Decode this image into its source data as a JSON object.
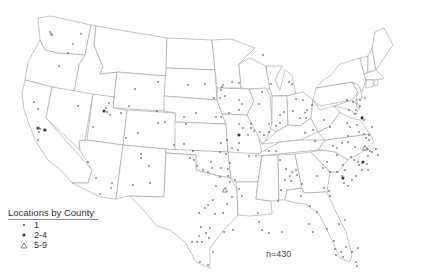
{
  "legend": {
    "title": "Locations by County",
    "items": [
      {
        "symbol": "small-dot",
        "label": "1"
      },
      {
        "symbol": "large-dot",
        "label": "2-4"
      },
      {
        "symbol": "triangle",
        "label": "5-9"
      }
    ]
  },
  "annotation": {
    "n_label": "n=430"
  },
  "colors": {
    "outline": "#9a9a9a",
    "points": "#333333",
    "background": "#ffffff"
  },
  "points": [
    [
      50,
      32
    ],
    [
      51,
      34
    ],
    [
      52,
      35
    ],
    [
      81,
      34
    ],
    [
      73,
      44
    ],
    [
      68,
      53
    ],
    [
      59,
      66
    ],
    [
      135,
      89
    ],
    [
      158,
      82
    ],
    [
      129,
      106
    ],
    [
      157,
      111
    ],
    [
      188,
      85
    ],
    [
      34,
      102
    ],
    [
      38,
      109
    ],
    [
      78,
      106
    ],
    [
      106,
      108
    ],
    [
      107,
      112
    ],
    [
      109,
      103
    ],
    [
      104,
      111
    ],
    [
      110,
      115
    ],
    [
      121,
      113
    ],
    [
      38,
      128
    ],
    [
      40,
      129
    ],
    [
      44,
      130
    ],
    [
      39,
      132
    ],
    [
      38,
      140
    ],
    [
      93,
      127
    ],
    [
      88,
      162
    ],
    [
      96,
      178
    ],
    [
      111,
      188
    ],
    [
      100,
      194
    ],
    [
      141,
      154
    ],
    [
      141,
      158
    ],
    [
      150,
      183
    ],
    [
      126,
      138
    ],
    [
      138,
      133
    ],
    [
      158,
      123
    ],
    [
      165,
      122
    ],
    [
      184,
      117
    ],
    [
      186,
      124
    ],
    [
      196,
      113
    ],
    [
      216,
      117
    ],
    [
      221,
      117
    ],
    [
      205,
      84
    ],
    [
      223,
      85
    ],
    [
      222,
      87
    ],
    [
      221,
      90
    ],
    [
      225,
      96
    ],
    [
      239,
      83
    ],
    [
      232,
      82
    ],
    [
      174,
      145
    ],
    [
      149,
      166
    ],
    [
      133,
      185
    ],
    [
      112,
      183
    ],
    [
      190,
      158
    ],
    [
      193,
      151
    ],
    [
      184,
      144
    ],
    [
      194,
      160
    ],
    [
      197,
      166
    ],
    [
      203,
      170
    ],
    [
      208,
      172
    ],
    [
      263,
      55
    ],
    [
      214,
      98
    ],
    [
      220,
      98
    ],
    [
      229,
      113
    ],
    [
      239,
      110
    ],
    [
      242,
      104
    ],
    [
      239,
      100
    ],
    [
      251,
      124
    ],
    [
      259,
      104
    ],
    [
      262,
      92
    ],
    [
      271,
      84
    ],
    [
      289,
      82
    ],
    [
      292,
      84
    ],
    [
      239,
      124
    ],
    [
      243,
      128
    ],
    [
      251,
      128
    ],
    [
      254,
      131
    ],
    [
      248,
      135
    ],
    [
      260,
      132
    ],
    [
      239,
      143
    ],
    [
      238,
      150
    ],
    [
      249,
      156
    ],
    [
      256,
      156
    ],
    [
      269,
      151
    ],
    [
      276,
      151
    ],
    [
      280,
      160
    ],
    [
      286,
      169
    ],
    [
      292,
      172
    ],
    [
      296,
      170
    ],
    [
      297,
      175
    ],
    [
      290,
      176
    ],
    [
      221,
      143
    ],
    [
      227,
      140
    ],
    [
      232,
      148
    ],
    [
      220,
      152
    ],
    [
      226,
      154
    ],
    [
      211,
      162
    ],
    [
      212,
      168
    ],
    [
      221,
      168
    ],
    [
      230,
      163
    ],
    [
      216,
      186
    ],
    [
      213,
      200
    ],
    [
      208,
      205
    ],
    [
      199,
      213
    ],
    [
      205,
      208
    ],
    [
      215,
      214
    ],
    [
      223,
      213
    ],
    [
      227,
      204
    ],
    [
      232,
      197
    ],
    [
      242,
      196
    ],
    [
      239,
      189
    ],
    [
      201,
      227
    ],
    [
      210,
      228
    ],
    [
      197,
      242
    ],
    [
      202,
      242
    ],
    [
      209,
      238
    ],
    [
      213,
      252
    ],
    [
      208,
      265
    ],
    [
      200,
      262
    ],
    [
      192,
      242
    ],
    [
      199,
      236
    ],
    [
      206,
      233
    ],
    [
      224,
      232
    ],
    [
      233,
      230
    ],
    [
      258,
      213
    ],
    [
      259,
      222
    ],
    [
      262,
      230
    ],
    [
      269,
      233
    ],
    [
      282,
      232
    ],
    [
      278,
      201
    ],
    [
      281,
      190
    ],
    [
      285,
      180
    ],
    [
      291,
      181
    ],
    [
      302,
      184
    ],
    [
      301,
      196
    ],
    [
      310,
      206
    ],
    [
      317,
      212
    ],
    [
      309,
      224
    ],
    [
      313,
      232
    ],
    [
      327,
      229
    ],
    [
      334,
      241
    ],
    [
      335,
      249
    ],
    [
      336,
      255
    ],
    [
      341,
      252
    ],
    [
      343,
      257
    ],
    [
      346,
      247
    ],
    [
      352,
      252
    ],
    [
      356,
      262
    ],
    [
      358,
      248
    ],
    [
      357,
      266
    ],
    [
      339,
      224
    ],
    [
      345,
      220
    ],
    [
      317,
      176
    ],
    [
      324,
      188
    ],
    [
      329,
      191
    ],
    [
      330,
      196
    ],
    [
      323,
      168
    ],
    [
      330,
      172
    ],
    [
      327,
      162
    ],
    [
      342,
      176
    ],
    [
      348,
      186
    ],
    [
      344,
      183
    ],
    [
      351,
      157
    ],
    [
      354,
      160
    ],
    [
      358,
      162
    ],
    [
      359,
      165
    ],
    [
      362,
      163
    ],
    [
      362,
      170
    ],
    [
      367,
      164
    ],
    [
      368,
      170
    ],
    [
      356,
      176
    ],
    [
      352,
      180
    ],
    [
      345,
      170
    ],
    [
      337,
      172
    ],
    [
      343,
      165
    ],
    [
      337,
      155
    ],
    [
      348,
      136
    ],
    [
      348,
      142
    ],
    [
      355,
      147
    ],
    [
      342,
      143
    ],
    [
      333,
      146
    ],
    [
      337,
      148
    ],
    [
      356,
      110
    ],
    [
      355,
      114
    ],
    [
      362,
      117
    ],
    [
      364,
      120
    ],
    [
      357,
      125
    ],
    [
      350,
      127
    ],
    [
      347,
      123
    ],
    [
      359,
      132
    ],
    [
      364,
      134
    ],
    [
      369,
      135
    ],
    [
      372,
      127
    ],
    [
      369,
      140
    ],
    [
      366,
      138
    ],
    [
      370,
      151
    ],
    [
      368,
      149
    ],
    [
      376,
      149
    ],
    [
      372,
      152
    ],
    [
      378,
      155
    ],
    [
      368,
      156
    ],
    [
      330,
      127
    ],
    [
      324,
      120
    ],
    [
      313,
      130
    ],
    [
      315,
      141
    ],
    [
      305,
      133
    ],
    [
      300,
      118
    ],
    [
      307,
      110
    ],
    [
      303,
      100
    ],
    [
      305,
      113
    ],
    [
      312,
      105
    ],
    [
      296,
      99
    ],
    [
      284,
      112
    ],
    [
      293,
      111
    ],
    [
      306,
      118
    ],
    [
      276,
      126
    ],
    [
      280,
      123
    ],
    [
      280,
      115
    ],
    [
      269,
      124
    ],
    [
      269,
      132
    ],
    [
      264,
      135
    ],
    [
      347,
      100
    ],
    [
      353,
      102
    ],
    [
      360,
      100
    ],
    [
      365,
      98
    ],
    [
      349,
      110
    ],
    [
      360,
      106
    ],
    [
      228,
      169
    ],
    [
      228,
      176
    ],
    [
      220,
      177
    ],
    [
      230,
      182
    ],
    [
      235,
      180
    ]
  ],
  "large_points": [
    [
      38,
      128
    ],
    [
      45,
      130
    ],
    [
      104,
      111
    ],
    [
      239,
      135
    ],
    [
      363,
      162
    ],
    [
      362,
      118
    ],
    [
      343,
      178
    ]
  ],
  "triangles": [
    [
      225,
      190
    ],
    [
      365,
      148
    ]
  ]
}
